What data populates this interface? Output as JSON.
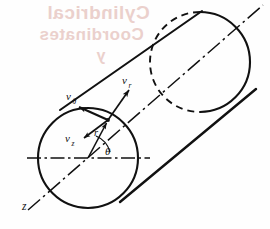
{
  "figure": {
    "background_color": "#fefefe",
    "line_color": "#111111",
    "bleed_color": "#e8c9c4",
    "labels": {
      "v_theta": "v",
      "v_theta_sub": "θ",
      "v_r": "v",
      "v_r_sub": "r",
      "v_z": "v",
      "v_z_sub": "z",
      "radius": "r",
      "angle": "θ",
      "axis": "z"
    },
    "bleed_text": {
      "line1": "Cylindrical",
      "line2": "Coordinates",
      "line3": "y"
    },
    "geometry": {
      "near_circle": {
        "cx": 88,
        "cy": 158,
        "r": 50
      },
      "far_circle": {
        "cx": 200,
        "cy": 62,
        "r": 50
      },
      "axis_start": {
        "x": 28,
        "y": 210
      },
      "axis_end": {
        "x": 263,
        "y": 5
      },
      "horizontal_line": {
        "x1": 27,
        "y1": 158,
        "x2": 150,
        "y2": 158
      },
      "point_on_surface": {
        "x": 108,
        "y": 120
      },
      "upper_edge": {
        "x1": 60,
        "y1": 110,
        "x2": 202,
        "y2": 11
      },
      "lower_edge": {
        "x1": 120,
        "y1": 202,
        "x2": 256,
        "y2": 89
      }
    },
    "vectors": [
      {
        "name": "v_r",
        "from": {
          "x": 108,
          "y": 120
        },
        "to": {
          "x": 130,
          "y": 88
        }
      },
      {
        "name": "v_theta",
        "from": {
          "x": 108,
          "y": 120
        },
        "to": {
          "x": 77,
          "y": 106
        }
      },
      {
        "name": "v_z",
        "from": {
          "x": 108,
          "y": 120
        },
        "to": {
          "x": 82,
          "y": 139
        }
      },
      {
        "name": "r",
        "from": {
          "x": 88,
          "y": 158
        },
        "to": {
          "x": 108,
          "y": 120
        }
      }
    ]
  }
}
